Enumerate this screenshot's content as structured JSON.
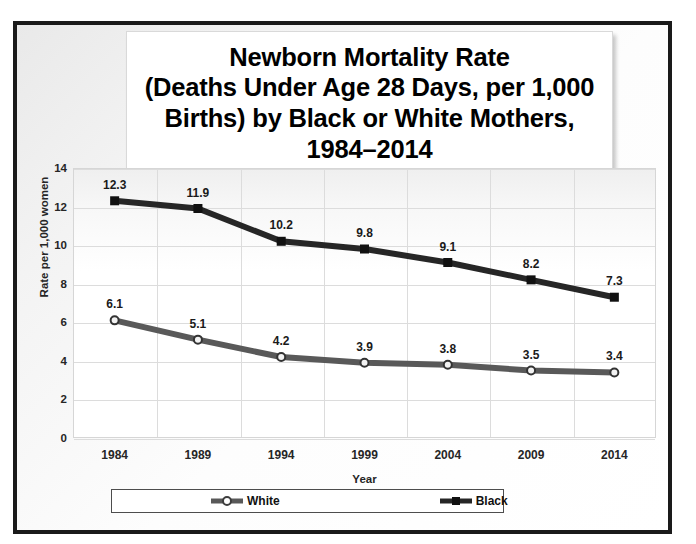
{
  "chart_data": {
    "type": "line",
    "title": "Newborn Mortality Rate\n(Deaths Under Age 28 Days, per 1,000\nBirths) by Black or White Mothers,\n1984–2014",
    "xlabel": "Year",
    "ylabel": "Rate per 1,000 women",
    "categories": [
      "1984",
      "1989",
      "1994",
      "1999",
      "2004",
      "2009",
      "2014"
    ],
    "ylim": [
      0,
      14
    ],
    "yticks": [
      "14",
      "12",
      "10",
      "8",
      "6",
      "4",
      "2",
      "0"
    ],
    "grid": true,
    "legend_position": "bottom",
    "series": [
      {
        "name": "White",
        "color": "#595959",
        "marker": "circle-open",
        "values": [
          6.1,
          5.1,
          4.2,
          3.9,
          3.8,
          3.5,
          3.4
        ],
        "labels": [
          "6.1",
          "5.1",
          "4.2",
          "3.9",
          "3.8",
          "3.5",
          "3.4"
        ]
      },
      {
        "name": "Black",
        "color": "#262626",
        "marker": "square-filled",
        "values": [
          12.3,
          11.9,
          10.2,
          9.8,
          9.1,
          8.2,
          7.3
        ],
        "labels": [
          "12.3",
          "11.9",
          "10.2",
          "9.8",
          "9.1",
          "8.2",
          "7.3"
        ]
      }
    ]
  },
  "legend": {
    "white_label": "White",
    "black_label": "Black"
  },
  "colors": {
    "frame_border": "#1a1a1a",
    "white_series": "#595959",
    "black_series": "#262626",
    "gridline": "#dcdcdc",
    "text": "#262626"
  }
}
